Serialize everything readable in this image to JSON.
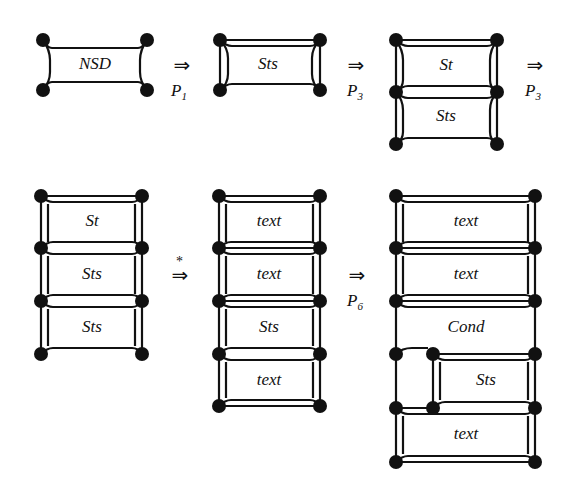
{
  "derivations": [
    {
      "id": "g1",
      "labels": [
        "NSD"
      ]
    },
    {
      "id": "g2",
      "labels": [
        "Sts"
      ]
    },
    {
      "id": "g3",
      "labels": [
        "St",
        "Sts"
      ]
    },
    {
      "id": "g4",
      "labels": [
        "St",
        "Sts",
        "Sts"
      ]
    },
    {
      "id": "g5",
      "labels": [
        "text",
        "text",
        "Sts",
        "text"
      ]
    },
    {
      "id": "g6",
      "labels": [
        "text",
        "text",
        "Cond",
        "Sts",
        "text"
      ]
    }
  ],
  "arrows": [
    {
      "symbol": "⇒",
      "sub": "P",
      "subn": "1"
    },
    {
      "symbol": "⇒",
      "sub": "P",
      "subn": "3"
    },
    {
      "symbol": "⇒",
      "sub": "P",
      "subn": "3"
    },
    {
      "symbol": "⇒",
      "star": "*"
    },
    {
      "symbol": "⇒",
      "sub": "P",
      "subn": "6"
    }
  ]
}
